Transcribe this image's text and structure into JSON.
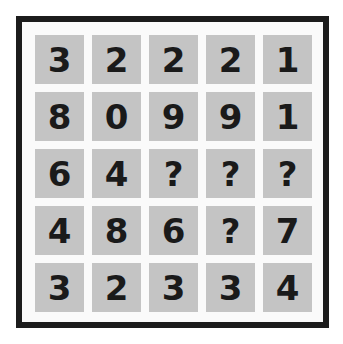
{
  "puzzle": {
    "rows": [
      [
        "3",
        "2",
        "2",
        "2",
        "1"
      ],
      [
        "8",
        "0",
        "9",
        "9",
        "1"
      ],
      [
        "6",
        "4",
        "?",
        "?",
        "?"
      ],
      [
        "4",
        "8",
        "6",
        "?",
        "7"
      ],
      [
        "3",
        "2",
        "3",
        "3",
        "4"
      ]
    ]
  },
  "colors": {
    "border": "#1c1c1c",
    "cell": "#c4c4c4",
    "text": "#1a1a1a",
    "background": "#fafafa"
  }
}
